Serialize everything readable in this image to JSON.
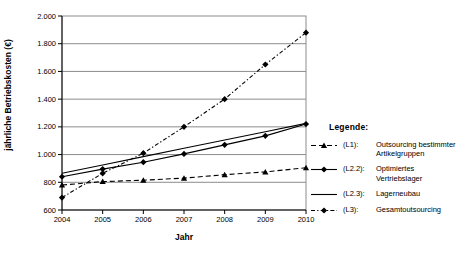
{
  "chart_data": {
    "type": "line",
    "title": "",
    "xlabel": "Jahr",
    "ylabel": "jährliche Betriebskosten (€)",
    "x": [
      2004,
      2005,
      2006,
      2007,
      2008,
      2009,
      2010
    ],
    "x_tick_labels": [
      "2004",
      "2005",
      "2006",
      "2007",
      "2008",
      "2009",
      "2010"
    ],
    "ylim": [
      600,
      2000
    ],
    "y_ticks": [
      600,
      800,
      1000,
      1200,
      1400,
      1600,
      1800,
      2000
    ],
    "y_tick_labels": [
      "600",
      "800",
      "1.000",
      "1.200",
      "1.400",
      "1.600",
      "1.800",
      "2.000"
    ],
    "grid": "horizontal",
    "line_color": "#000000",
    "grid_color": "#8c8c8c",
    "legend": {
      "title": "Legende:",
      "position": "right-of-plot"
    },
    "series": [
      {
        "legend_code": "(L1):",
        "legend_label": "Outsourcing bestimmter Artikelgruppen",
        "line": "dashed",
        "marker": "triangle",
        "values": [
          780,
          805,
          815,
          830,
          855,
          875,
          905
        ]
      },
      {
        "legend_code": "(L2.2):",
        "legend_label": "Optimiertes Vertriebslager",
        "line": "solid",
        "marker": "diamond",
        "values": [
          840,
          895,
          945,
          1005,
          1070,
          1135,
          1220
        ]
      },
      {
        "legend_code": "(L2.3):",
        "legend_label": "Lagerneubau",
        "line": "solid",
        "marker": "none",
        "values": [
          865,
          925,
          985,
          1045,
          1105,
          1165,
          1225
        ]
      },
      {
        "legend_code": "(L3):",
        "legend_label": "Gesamtoutsourcing",
        "line": "dashdot",
        "marker": "diamond",
        "values": [
          690,
          865,
          1010,
          1200,
          1400,
          1650,
          1880
        ]
      }
    ]
  }
}
